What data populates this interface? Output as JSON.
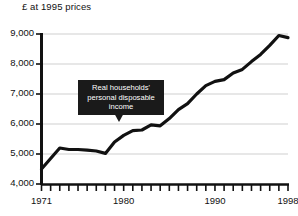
{
  "chart_data": {
    "type": "line",
    "title": "£ at 1995 prices",
    "xlabel": "",
    "ylabel": "£ at 1995 prices",
    "ylim": [
      4000,
      9000
    ],
    "xlim": [
      1971,
      1998
    ],
    "grid": true,
    "legend": "none",
    "y_ticks": [
      "9,000",
      "8,000",
      "7,000",
      "6,000",
      "5,000",
      "4,000"
    ],
    "y_tick_values": [
      9000,
      8000,
      7000,
      6000,
      5000,
      4000
    ],
    "x_tick_years": [
      1971,
      1972,
      1973,
      1974,
      1975,
      1976,
      1977,
      1978,
      1979,
      1980,
      1981,
      1982,
      1983,
      1984,
      1985,
      1986,
      1987,
      1988,
      1989,
      1990,
      1991,
      1992,
      1993,
      1994,
      1995,
      1996,
      1997,
      1998
    ],
    "x_tick_labels": [
      {
        "year": 1971,
        "label": "1971"
      },
      {
        "year": 1980,
        "label": "1980"
      },
      {
        "year": 1990,
        "label": "1990"
      },
      {
        "year": 1998,
        "label": "1998"
      }
    ],
    "series": [
      {
        "name": "Real households' personal disposable income",
        "x": [
          1971,
          1972,
          1973,
          1974,
          1975,
          1976,
          1977,
          1978,
          1979,
          1980,
          1981,
          1982,
          1983,
          1984,
          1985,
          1986,
          1987,
          1988,
          1989,
          1990,
          1991,
          1992,
          1993,
          1994,
          1995,
          1996,
          1997,
          1998
        ],
        "values": [
          4500,
          4850,
          5200,
          5150,
          5150,
          5130,
          5100,
          5020,
          5400,
          5620,
          5780,
          5800,
          5970,
          5940,
          6180,
          6480,
          6680,
          7000,
          7280,
          7420,
          7480,
          7700,
          7820,
          8080,
          8320,
          8620,
          8950,
          8880
        ]
      }
    ],
    "annotations": [
      {
        "name": "callout",
        "lines": [
          "Real households'",
          "personal disposable",
          "income"
        ],
        "points_to_year": 1983,
        "style": "black-box-white-text-with-down-arrow"
      }
    ],
    "colors": {
      "line": "#111111",
      "grid": "#cfcfcf",
      "axis": "#111111",
      "background": "#ffffff",
      "callout_bg": "#1a1a1a",
      "callout_text": "#ffffff"
    }
  }
}
